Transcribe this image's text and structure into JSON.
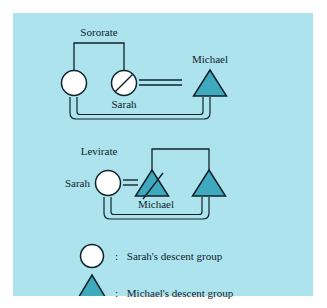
{
  "figure": {
    "type": "kinship-diagram",
    "background_color": "#ace3ec",
    "page_background": "#ffffff",
    "line_color": "#10232c",
    "circle_fill": "#ffffff",
    "triangle_fill": "#3fa9bd",
    "text_color": "#10232c"
  },
  "sororate": {
    "title": "Sororate",
    "nodes": {
      "sister_alive": {
        "shape": "circle",
        "label": "",
        "deceased": false
      },
      "sister_deceased": {
        "shape": "circle",
        "label": "Sarah",
        "deceased": true
      },
      "husband": {
        "shape": "triangle",
        "label": "Michael",
        "deceased": false
      }
    },
    "links": {
      "sibling_bar": "sister_alive-sister_deceased",
      "marriage": "sister_deceased=husband",
      "descent_bracket": "sister_alive-husband"
    }
  },
  "levirate": {
    "title": "Levirate",
    "nodes": {
      "wife": {
        "shape": "circle",
        "label": "Sarah",
        "deceased": false
      },
      "brother_deceased": {
        "shape": "triangle",
        "label": "Michael",
        "deceased": true
      },
      "brother_alive": {
        "shape": "triangle",
        "label": "",
        "deceased": false
      }
    },
    "links": {
      "sibling_bar": "brother_deceased-brother_alive",
      "marriage": "wife=brother_deceased",
      "descent_bracket": "wife-brother_alive"
    }
  },
  "legend": {
    "items": [
      {
        "symbol": "circle",
        "separator": ":",
        "label": "Sarah's descent group"
      },
      {
        "symbol": "triangle",
        "separator": ":",
        "label": "Michael's descent group"
      }
    ]
  }
}
